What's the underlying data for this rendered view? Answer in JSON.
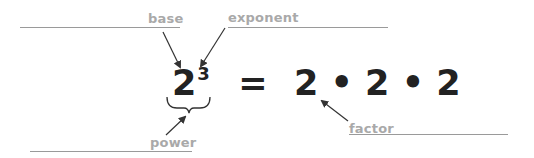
{
  "labels": {
    "base": "base",
    "exponent": "exponent",
    "power": "power",
    "factor": "factor"
  },
  "equation": {
    "base": "2",
    "exponent": "3",
    "equals": "=",
    "factors": [
      "2",
      "2",
      "2"
    ],
    "operator": "•"
  },
  "colors": {
    "label": "#a9a9a9",
    "rule": "#9a9a9a",
    "equation": "#222222",
    "arrow": "#333333"
  }
}
